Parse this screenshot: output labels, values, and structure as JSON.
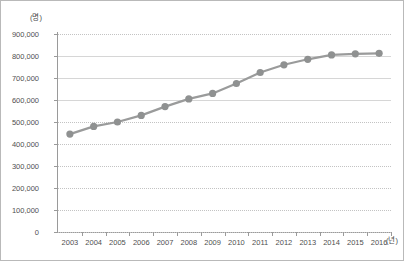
{
  "chart_data": {
    "type": "line",
    "title": "",
    "xlabel": "(년)",
    "ylabel": "(명)",
    "x_unit_label": "(년)",
    "y_unit_label": "(명)",
    "grid": true,
    "legend": "none",
    "categories": [
      "2003",
      "2004",
      "2005",
      "2006",
      "2007",
      "2008",
      "2009",
      "2010",
      "2011",
      "2012",
      "2013",
      "2014",
      "2015",
      "2016"
    ],
    "values": [
      445000,
      480000,
      500000,
      530000,
      570000,
      605000,
      630000,
      675000,
      725000,
      760000,
      785000,
      805000,
      810000,
      812000
    ],
    "series": [
      {
        "name": "",
        "values": [
          445000,
          480000,
          500000,
          530000,
          570000,
          605000,
          630000,
          675000,
          725000,
          760000,
          785000,
          805000,
          810000,
          812000
        ]
      }
    ],
    "ylim": [
      0,
      900000
    ],
    "y_ticks": [
      900000,
      800000,
      700000,
      600000,
      500000,
      400000,
      300000,
      200000,
      100000,
      0
    ],
    "y_tick_labels": [
      "900,000",
      "800,000",
      "700,000",
      "600,000",
      "500,000",
      "400,000",
      "300,000",
      "200,000",
      "100,000",
      "0"
    ],
    "x_ticks": [
      "2003",
      "2004",
      "2005",
      "2006",
      "2007",
      "2008",
      "2009",
      "2010",
      "2011",
      "2012",
      "2013",
      "2014",
      "2015",
      "2016"
    ],
    "marker": "circle",
    "colors": {
      "line": "#9a9b9b",
      "marker": "#8f9191",
      "gridline": "#c3c3c3",
      "axis": "#9a9a9a",
      "tick_text": "#4f4f4f",
      "border": "#b9b9b9",
      "background": "#ffffff"
    }
  }
}
